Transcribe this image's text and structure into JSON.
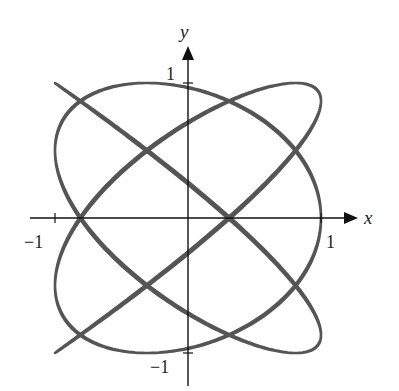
{
  "chart_data": {
    "type": "line",
    "title": "",
    "xlabel": "x",
    "ylabel": "y",
    "xlim": [
      -1.25,
      1.3
    ],
    "ylim": [
      -1.22,
      1.25
    ],
    "grid": false,
    "legend": null,
    "curve": {
      "x_expr": "sin(6t + 0.3)",
      "y_expr": "sin(5t)",
      "a": 6,
      "b": 5,
      "phase": 0.3,
      "t_range": [
        0,
        6.2832
      ],
      "samples": 1400,
      "color": "#555555",
      "stroke_width": 2.6
    },
    "x_axis_crossings_at_y0": [
      -0.89,
      -0.62,
      -0.23,
      0.23,
      0.62,
      0.9
    ],
    "y_axis_crossings_at_x0": [
      1,
      0.81,
      0.31,
      -0.31,
      -0.81,
      -1
    ],
    "ticks": {
      "x": [
        {
          "value": -1,
          "label": "−1"
        },
        {
          "value": 1,
          "label": "1"
        }
      ],
      "y": [
        {
          "value": 1,
          "label": "1"
        },
        {
          "value": -1,
          "label": "−1"
        }
      ]
    }
  },
  "axes": {
    "x_name": "x",
    "y_name": "y",
    "x_tick_neg": "−1",
    "x_tick_pos": "1",
    "y_tick_pos": "1",
    "y_tick_neg": "−1",
    "color": "#111111"
  },
  "layout_px": {
    "origin_x": 188,
    "origin_y": 218,
    "scale_x": 133,
    "scale_y": 135
  }
}
